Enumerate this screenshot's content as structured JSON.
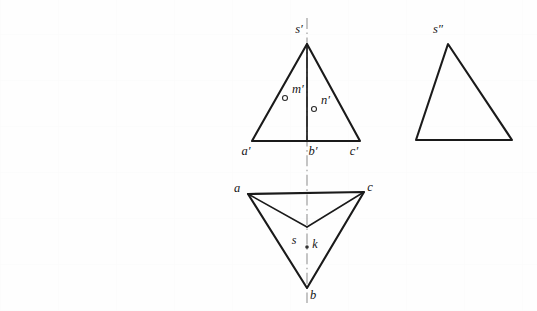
{
  "document": {
    "kind": "engineering-drawing",
    "description": "Orthographic projection of a triangular pyramid with front view, side view and top view",
    "background_color": "#fefefe",
    "ink_color": "#1a1a1a",
    "axis_color": "#9a9a9a"
  },
  "front_view": {
    "name": "front-view",
    "apex": {
      "x": 307,
      "y": 44
    },
    "base_left": {
      "x": 252,
      "y": 141
    },
    "base_right": {
      "x": 360,
      "y": 141
    },
    "base_mid": {
      "x": 307,
      "y": 141
    },
    "labels": {
      "apex": "s′",
      "base_left": "a′",
      "base_mid": "b′",
      "base_right": "c′",
      "point_m": "m′",
      "point_n": "n′"
    },
    "label_positions": {
      "apex": {
        "x": 299,
        "y": 33
      },
      "base_left": {
        "x": 246,
        "y": 155
      },
      "base_mid": {
        "x": 313,
        "y": 155
      },
      "base_right": {
        "x": 354,
        "y": 155
      },
      "point_m": {
        "x": 292,
        "y": 93
      },
      "point_n": {
        "x": 321,
        "y": 104
      }
    },
    "points": [
      {
        "id": "m-prime",
        "x": 285,
        "y": 98,
        "marker": "ring"
      },
      {
        "id": "n-prime",
        "x": 314,
        "y": 109,
        "marker": "ring"
      }
    ]
  },
  "side_view": {
    "name": "side-view",
    "apex": {
      "x": 448,
      "y": 44
    },
    "base_left": {
      "x": 416,
      "y": 140
    },
    "base_right": {
      "x": 512,
      "y": 140
    },
    "labels": {
      "apex": "s″"
    },
    "label_positions": {
      "apex": {
        "x": 438,
        "y": 33
      }
    }
  },
  "top_view": {
    "name": "top-view",
    "vertex_a": {
      "x": 248,
      "y": 194
    },
    "vertex_c": {
      "x": 364,
      "y": 192
    },
    "vertex_b": {
      "x": 307,
      "y": 288
    },
    "inner_apex": {
      "x": 307,
      "y": 227
    },
    "labels": {
      "vertex_a": "a",
      "vertex_b": "b",
      "vertex_c": "c",
      "point_s": "s",
      "point_k": "k"
    },
    "label_positions": {
      "vertex_a": {
        "x": 237,
        "y": 192
      },
      "vertex_b": {
        "x": 313,
        "y": 299
      },
      "vertex_c": {
        "x": 370,
        "y": 191
      },
      "point_s": {
        "x": 294,
        "y": 244
      },
      "point_k": {
        "x": 315,
        "y": 248
      }
    },
    "points": [
      {
        "id": "k-point",
        "x": 307,
        "y": 247,
        "marker": "dot"
      }
    ]
  },
  "center_line": {
    "name": "vertical-center-line",
    "x": 307,
    "y_top": 18,
    "y_bottom": 303,
    "style": "dash-dot"
  }
}
